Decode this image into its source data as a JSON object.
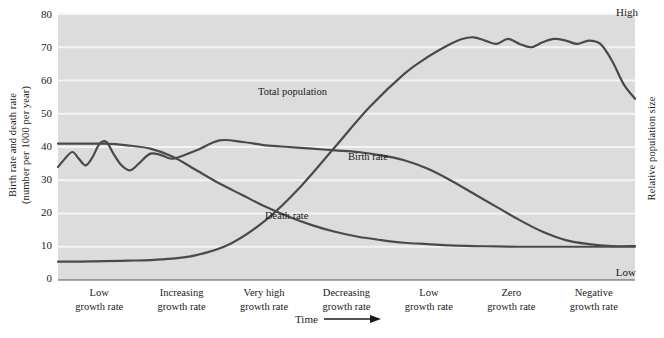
{
  "chart_data": {
    "type": "line",
    "title": "",
    "xlabel": "Time",
    "ylabel_left": "Birth rate and death rate (number per 1000 per year)",
    "ylabel_right": "Relative population size",
    "yticks_left": [
      0,
      10,
      20,
      30,
      40,
      50,
      60,
      70,
      80
    ],
    "ylim_left": [
      0,
      80
    ],
    "right_axis_labels": {
      "high": "High",
      "low": "Low"
    },
    "grid": "horizontal-white-on-gray",
    "legend": "inline-curve-labels",
    "categories": [
      "Low growth rate",
      "Increasing growth rate",
      "Very high growth rate",
      "Decreasing growth rate",
      "Low growth rate",
      "Zero growth rate",
      "Negative growth rate"
    ],
    "series": [
      {
        "name": "Birth rate",
        "label": "Birth rate",
        "x": [
          0,
          1.2,
          2.5,
          3.6,
          4.8,
          6.0,
          7.2,
          8.4,
          9.6,
          11.0,
          12.5,
          14.0,
          16.0,
          18.0,
          20.0,
          24.0,
          28.0,
          32.0,
          36.0,
          40.0,
          44.0,
          48.0,
          52.0,
          56.0,
          60.0,
          64.0,
          68.0,
          72.0,
          76.0,
          80.0,
          84.0,
          88.0,
          92.0,
          96.0,
          100.0
        ],
        "values": [
          34,
          36.5,
          38.5,
          36.5,
          34.5,
          37,
          41,
          41.5,
          38,
          34.5,
          33,
          35,
          38,
          37.5,
          36.5,
          39,
          42,
          41.5,
          40.5,
          40,
          39.5,
          39,
          38.5,
          37.5,
          36,
          33.5,
          30,
          26,
          22,
          18,
          14.5,
          12,
          10.8,
          10.2,
          10.2
        ]
      },
      {
        "name": "Death rate",
        "label": "Death rate",
        "x": [
          0,
          4,
          8,
          12,
          16,
          20,
          24,
          28,
          32,
          36,
          40,
          44,
          48,
          52,
          56,
          60,
          64,
          68,
          72,
          76,
          80,
          84,
          88,
          92,
          96,
          100
        ],
        "values": [
          41,
          41,
          41,
          40.5,
          39.5,
          37,
          33,
          29,
          25.5,
          22,
          19,
          16.5,
          14.5,
          13,
          12,
          11.2,
          10.8,
          10.4,
          10.2,
          10.1,
          10.0,
          10.0,
          10.0,
          10.0,
          10.0,
          10.0
        ]
      },
      {
        "name": "Total population",
        "label": "Total population",
        "axis": "right",
        "x": [
          0,
          6,
          12,
          18,
          24,
          30,
          36,
          42,
          48,
          54,
          60,
          64,
          68,
          70,
          72,
          74,
          76,
          78,
          80,
          82,
          84,
          86,
          88,
          90,
          92,
          94,
          96,
          98,
          100
        ],
        "values": [
          5.5,
          5.6,
          5.8,
          6.2,
          7.5,
          11,
          18,
          28,
          40,
          52,
          62,
          67,
          71,
          72.5,
          73,
          72,
          71,
          72.5,
          71,
          70,
          71.5,
          72.5,
          72,
          71,
          72,
          71,
          66,
          59,
          54.5
        ]
      }
    ],
    "annotations": [
      {
        "name": "birth-rate-oscillation-stage1",
        "note": "Birth rate fluctuates between ~33 and ~42 during Low growth rate stage"
      },
      {
        "name": "birth-rate-oscillation-zero-stage",
        "note": "Birth rate oscillates around 10 during Zero growth rate stage"
      },
      {
        "name": "population-plateau",
        "note": "Total population plateaus near 73 with small fluctuations before declining"
      }
    ]
  },
  "colors": {
    "plot_background": "#dcdcdc",
    "gridline": "#f4f4f4",
    "curve": "#4a4a4a",
    "text": "#1a1a1a",
    "axis": "#555555"
  },
  "ytick_labels": [
    "80",
    "70",
    "60",
    "50",
    "40",
    "30",
    "20",
    "10",
    "0"
  ],
  "axis_titles": {
    "left": "Birth rate and death rate (number per 1000 per year)",
    "left_line1": "Birth rate and death rate",
    "left_line2": "(number per 1000 per year)",
    "right": "Relative population size",
    "bottom": "Time"
  },
  "right_scale": {
    "high": "High",
    "low": "Low"
  },
  "stages": [
    {
      "line1": "Low",
      "line2": "growth rate"
    },
    {
      "line1": "Increasing",
      "line2": "growth rate"
    },
    {
      "line1": "Very high",
      "line2": "growth rate"
    },
    {
      "line1": "Decreasing",
      "line2": "growth rate"
    },
    {
      "line1": "Low",
      "line2": "growth rate"
    },
    {
      "line1": "Zero",
      "line2": "growth rate"
    },
    {
      "line1": "Negative",
      "line2": "growth rate"
    }
  ],
  "curve_labels": {
    "total_population": "Total population",
    "birth_rate": "Birth rate",
    "death_rate": "Death rate"
  }
}
